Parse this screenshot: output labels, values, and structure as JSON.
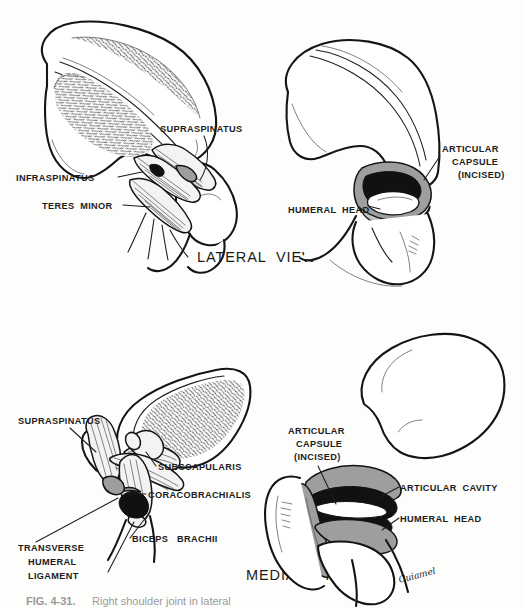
{
  "figure": {
    "background_color": "#fdfdfc",
    "ink_color": "#141414",
    "shade_gray": "#9e9e9e",
    "cavity_black": "#111111",
    "signature": "Cuiamel"
  },
  "panels": [
    {
      "id": "lateral-muscles",
      "view_label": "LATERAL  VIEW",
      "labels": [
        {
          "key": "supraspinatus",
          "text": "SUPRASPINATUS"
        },
        {
          "key": "infraspinatus",
          "text": "INFRASPINATUS"
        },
        {
          "key": "teres_minor",
          "text": "TERES  MINOR"
        }
      ]
    },
    {
      "id": "lateral-capsule",
      "view_label": "",
      "labels": [
        {
          "key": "articular_capsule_l1",
          "text": "ARTICULAR"
        },
        {
          "key": "articular_capsule_l2",
          "text": "CAPSULE"
        },
        {
          "key": "articular_capsule_l3",
          "text": "(INCISED)"
        },
        {
          "key": "humeral_head",
          "text": "HUMERAL  HEAD"
        }
      ]
    },
    {
      "id": "medial-muscles",
      "view_label": "MEDIAL  VIEW",
      "labels": [
        {
          "key": "supraspinatus",
          "text": "SUPRASPINATUS"
        },
        {
          "key": "subscapularis",
          "text": "SUBSCAPULARIS"
        },
        {
          "key": "coracobrachialis",
          "text": "CORACOBRACHIALIS"
        },
        {
          "key": "biceps_brachii",
          "text": "BICEPS   BRACHII"
        },
        {
          "key": "transverse_l1",
          "text": "TRANSVERSE"
        },
        {
          "key": "transverse_l2",
          "text": "HUMERAL"
        },
        {
          "key": "transverse_l3",
          "text": "LIGAMENT"
        }
      ]
    },
    {
      "id": "medial-capsule",
      "view_label": "",
      "labels": [
        {
          "key": "articular_capsule_l1",
          "text": "ARTICULAR"
        },
        {
          "key": "articular_capsule_l2",
          "text": "CAPSULE"
        },
        {
          "key": "articular_capsule_l3",
          "text": "(INCISED)"
        },
        {
          "key": "articular_cavity",
          "text": "ARTICULAR  CAVITY"
        },
        {
          "key": "humeral_head",
          "text": "HUMERAL  HEAD"
        }
      ]
    }
  ],
  "caption": {
    "number": "FIG. 4-31.",
    "text": "Right shoulder joint in lateral"
  }
}
